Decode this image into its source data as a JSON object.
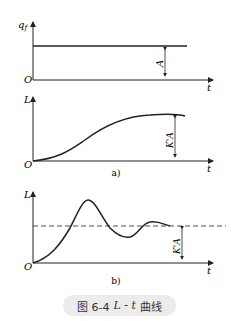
{
  "panels": {
    "top": {
      "y_label": "q",
      "y_sub": "f",
      "origin": "O",
      "x_label": "t",
      "amp_label": "A"
    },
    "a": {
      "y_label": "L",
      "origin": "O",
      "x_label": "t",
      "amp_label": "K'A",
      "sub_caption": "a)"
    },
    "b": {
      "y_label": "L",
      "origin": "O",
      "x_label": "t",
      "amp_label": "K'A",
      "sub_caption": "b)"
    }
  },
  "caption": {
    "prefix": "图 6-4",
    "formula": "L - t",
    "suffix": "曲线"
  },
  "colors": {
    "stroke": "#222222",
    "caption_bg": "#ececec"
  }
}
